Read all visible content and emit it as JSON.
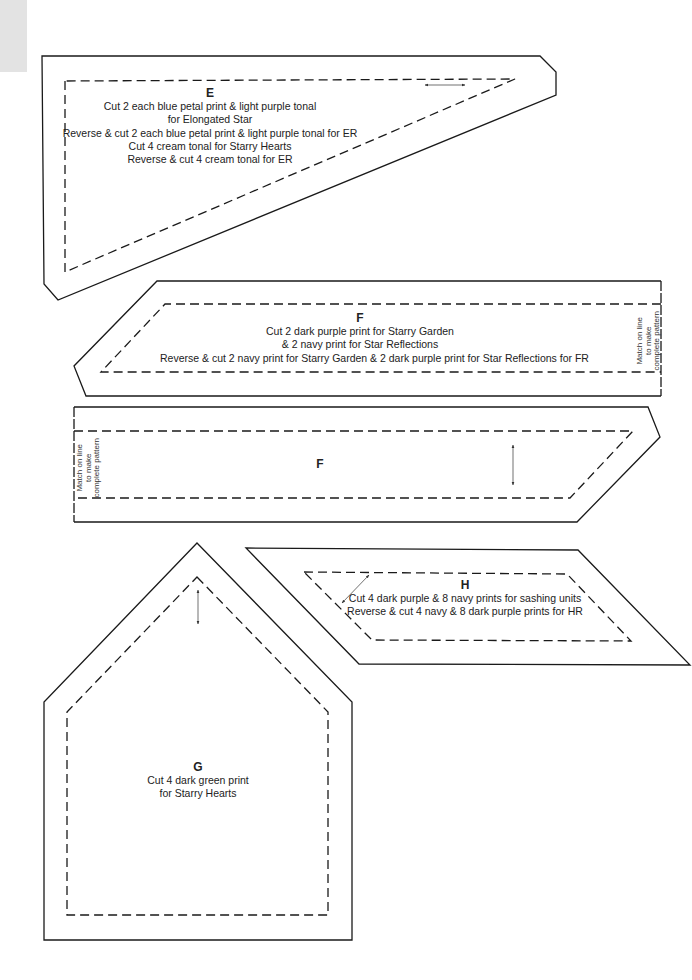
{
  "pieces": {
    "E": {
      "letter": "E",
      "lines": [
        "Cut 2 each blue petal print & light purple tonal",
        "for Elongated Star",
        "Reverse & cut 2 each  blue petal print & light purple tonal for ER",
        "Cut 4 cream tonal for Starry Hearts",
        "Reverse & cut 4 cream tonal for ER"
      ]
    },
    "F_top": {
      "letter": "F",
      "lines": [
        "Cut 2 dark purple print for Starry Garden",
        "& 2 navy print for Star Reflections",
        "Reverse & cut 2 navy print for Starry Garden & 2 dark purple print for Star Reflections for FR"
      ],
      "match_note": [
        "Match on line",
        "to make",
        "complete pattern"
      ]
    },
    "F_bottom": {
      "letter": "F",
      "match_note": [
        "Match on line",
        "to make",
        "complete pattern"
      ]
    },
    "G": {
      "letter": "G",
      "lines": [
        "Cut 4 dark green print",
        "for Starry Hearts"
      ]
    },
    "H": {
      "letter": "H",
      "lines": [
        "Cut 4 dark purple & 8 navy prints for sashing units",
        "Reverse & cut 4 navy & 8 dark purple prints for HR"
      ]
    }
  },
  "icons": {
    "grainline": "double-headed-arrow"
  },
  "colors": {
    "line": "#1a1a1a",
    "tab": "#e3e3e3",
    "background": "#ffffff"
  }
}
